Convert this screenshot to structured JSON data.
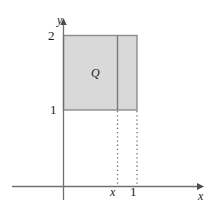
{
  "figure": {
    "background_color": "#ffffff"
  },
  "axes": {
    "x_axis": {
      "label": "x",
      "color": "#707070",
      "arrow": "right-arrow-icon",
      "y_position": 186,
      "x_start": 12,
      "x_end": 202
    },
    "y_axis": {
      "label": "y",
      "color": "#707070",
      "arrow": "up-arrow-icon",
      "x_position": 63,
      "y_top": 22,
      "y_bottom": 200
    },
    "x_ticks": [
      {
        "label": "x",
        "value": "x",
        "pixel_x": 114,
        "italic": true
      },
      {
        "label": "1",
        "value": "1",
        "pixel_x": 133,
        "italic": false
      }
    ],
    "y_ticks": [
      {
        "label": "2",
        "value": "2",
        "pixel_y": 35
      },
      {
        "label": "1",
        "value": "1",
        "pixel_y": 110
      }
    ]
  },
  "region": {
    "name": "Q",
    "label": "Q",
    "fill_color": "#d9d9d9",
    "stroke_color": "#8c8c8c",
    "x_left": 63,
    "x_right": 137,
    "y_top": 35,
    "y_bottom": 110,
    "domain": "1 ≤ x ≤ 2",
    "range": "1 ≤ y ≤ 2"
  },
  "cross_section": {
    "name": "vertical-slice-line",
    "pixel_x": 117,
    "stroke_color": "#7a7a7a"
  },
  "guide_lines": [
    {
      "name": "dotted-guide-x",
      "pixel_x": 117,
      "y_from": 110,
      "y_to": 186,
      "style": "dotted",
      "color": "#6e6e6e"
    },
    {
      "name": "dotted-guide-1",
      "pixel_x": 137,
      "y_from": 110,
      "y_to": 186,
      "style": "dotted",
      "color": "#6e6e6e"
    }
  ]
}
